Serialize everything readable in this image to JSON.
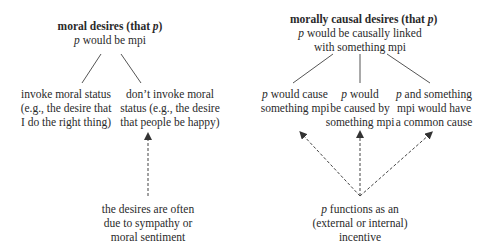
{
  "left_tree": {
    "title": "moral desires (that ",
    "title_var": "p",
    "title_close": ")",
    "subtitle_var": "p",
    "subtitle": " would be mpi",
    "children": [
      {
        "lines": [
          "invoke moral status",
          "(e.g., the desire that",
          "I do the right thing)"
        ]
      },
      {
        "lines": [
          "don’t invoke moral",
          "status (e.g., the desire",
          "that people be happy)"
        ]
      }
    ],
    "cause": {
      "lines": [
        "the desires are often",
        "due to sympathy or",
        "moral sentiment"
      ]
    }
  },
  "right_tree": {
    "title": "morally causal desires (that ",
    "title_var": "p",
    "title_close": ")",
    "subtitle_var": "p",
    "subtitle_line1": " would be causally linked",
    "subtitle_line2": "with something mpi",
    "children": [
      {
        "var": "p",
        "line1": " would cause",
        "line2": "something mpi",
        "line3": ""
      },
      {
        "var": "p",
        "line1": " would",
        "line2": "be caused by",
        "line3": "something mpi"
      },
      {
        "var": "p",
        "line1": " and something",
        "line2": "mpi would have",
        "line3": "a common cause"
      }
    ],
    "cause": {
      "var": "p",
      "line1": " functions as an",
      "line2": "(external or internal)",
      "line3": "incentive"
    }
  },
  "colors": {
    "text": "#2a2a2a",
    "line": "#555555",
    "dashed": "#444444"
  }
}
